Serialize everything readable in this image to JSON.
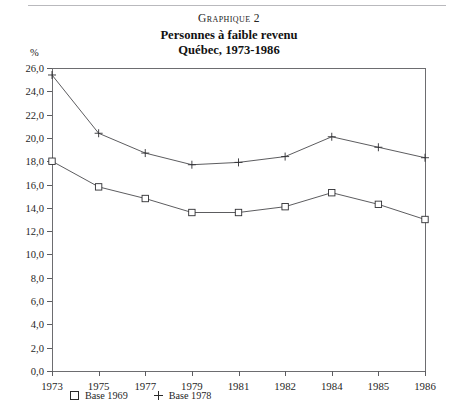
{
  "figure": {
    "label": "Graphique 2",
    "title_line1": "Personnes à faible revenu",
    "title_line2": "Québec, 1973-1986",
    "y_unit": "%"
  },
  "legend": {
    "position": "below-axis",
    "entries": [
      {
        "marker": "square-marker-icon",
        "label": "Base 1969"
      },
      {
        "marker": "plus-marker-icon",
        "label": "Base 1978"
      }
    ]
  },
  "chart_data": {
    "type": "line",
    "subtitle": "Graphique 2",
    "xlabel": "",
    "ylabel": "%",
    "categories": [
      "1973",
      "1975",
      "1977",
      "1979",
      "1981",
      "1982",
      "1984",
      "1985",
      "1986"
    ],
    "ylim": [
      0.0,
      26.0
    ],
    "ytick_step": 2.0,
    "ytick_labels": [
      "0,0",
      "2,0",
      "4,0",
      "6,0",
      "8,0",
      "10,0",
      "12,0",
      "14,0",
      "16,0",
      "18,0",
      "20,0",
      "22,0",
      "24,0",
      "26,0"
    ],
    "ytick_values": [
      0,
      2,
      4,
      6,
      8,
      10,
      12,
      14,
      16,
      18,
      20,
      22,
      24,
      26
    ],
    "grid": false,
    "legend_position": "bottom-left",
    "series": [
      {
        "name": "Base 1978",
        "marker": "plus",
        "values": [
          25.4,
          20.4,
          18.7,
          17.7,
          17.9,
          18.4,
          20.1,
          19.2,
          18.3
        ]
      },
      {
        "name": "Base 1969",
        "marker": "square",
        "values": [
          18.0,
          15.8,
          14.8,
          13.6,
          13.6,
          14.1,
          15.3,
          14.3,
          13.0
        ]
      }
    ]
  }
}
